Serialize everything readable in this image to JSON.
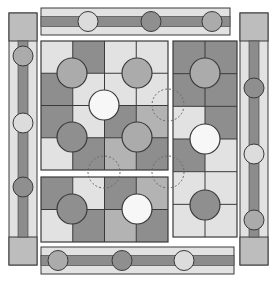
{
  "colors": {
    "light": "#e2e2e2",
    "mid": "#b3b3b3",
    "dark": "#8e8e8e",
    "white": "#f7f7f7",
    "token_mid": "#ababab",
    "token_dark": "#8f8f8f",
    "token_light": "#dcdcdc",
    "stroke": "#3a3a3a",
    "bar": "#8c8c8c",
    "cap": "#bdbdbd",
    "dashed": "#6a6a6a"
  },
  "boards": [
    {
      "name": "main-board",
      "x": 41,
      "y": 41,
      "cols": 4,
      "rows": 4,
      "cw": 31.75,
      "ch": 32.25,
      "cells": [
        [
          "light",
          "dark",
          "light",
          "light"
        ],
        [
          "dark",
          "light",
          "light",
          "light"
        ],
        [
          "dark",
          "light",
          "dark",
          "mid"
        ],
        [
          "light",
          "dark",
          "mid",
          "dark"
        ]
      ],
      "tokens": [
        {
          "cx": 72,
          "cy": 73,
          "r": 15,
          "fill": "token_mid"
        },
        {
          "cx": 137,
          "cy": 73,
          "r": 15,
          "fill": "token_mid"
        },
        {
          "cx": 104,
          "cy": 105,
          "r": 15,
          "fill": "white"
        },
        {
          "cx": 72,
          "cy": 137,
          "r": 15,
          "fill": "token_dark"
        },
        {
          "cx": 137,
          "cy": 137,
          "r": 15,
          "fill": "token_mid"
        }
      ]
    },
    {
      "name": "bottom-left-board",
      "x": 41,
      "y": 177,
      "cols": 4,
      "rows": 2,
      "cw": 31.75,
      "ch": 32.5,
      "cells": [
        [
          "dark",
          "light",
          "dark",
          "mid"
        ],
        [
          "light",
          "dark",
          "mid",
          "dark"
        ]
      ],
      "tokens": [
        {
          "cx": 72,
          "cy": 209,
          "r": 15,
          "fill": "token_dark"
        },
        {
          "cx": 137,
          "cy": 209,
          "r": 15,
          "fill": "white"
        }
      ]
    },
    {
      "name": "right-board",
      "x": 173,
      "y": 41,
      "cols": 2,
      "rows": 6,
      "cw": 32,
      "ch": 32.67,
      "cells": [
        [
          "dark",
          "dark"
        ],
        [
          "dark",
          "dark"
        ],
        [
          "light",
          "dark"
        ],
        [
          "dark",
          "light"
        ],
        [
          "light",
          "light"
        ],
        [
          "light",
          "light"
        ]
      ],
      "tokens": [
        {
          "cx": 205,
          "cy": 73,
          "r": 15,
          "fill": "token_mid"
        },
        {
          "cx": 205,
          "cy": 139,
          "r": 15,
          "fill": "white"
        },
        {
          "cx": 205,
          "cy": 205,
          "r": 15,
          "fill": "token_dark"
        }
      ]
    }
  ],
  "dashed_targets": [
    {
      "cx": 168,
      "cy": 105,
      "r": 16
    },
    {
      "cx": 104,
      "cy": 172,
      "r": 16
    },
    {
      "cx": 168,
      "cy": 172,
      "r": 16
    }
  ],
  "strips": [
    {
      "name": "top-strip",
      "orient": "h",
      "x": 41,
      "y": 8,
      "w": 189,
      "h": 27,
      "tokens": [
        {
          "pos": 88,
          "fill": "token_light"
        },
        {
          "pos": 151,
          "fill": "token_dark"
        },
        {
          "pos": 212,
          "fill": "token_mid"
        }
      ]
    },
    {
      "name": "bottom-strip",
      "orient": "h",
      "x": 41,
      "y": 247,
      "w": 193,
      "h": 27,
      "tokens": [
        {
          "pos": 58,
          "fill": "token_mid"
        },
        {
          "pos": 122,
          "fill": "token_dark"
        },
        {
          "pos": 184,
          "fill": "token_light"
        }
      ]
    },
    {
      "name": "left-strip",
      "orient": "v",
      "x": 9,
      "y": 13,
      "w": 28,
      "h": 252,
      "cap": 28,
      "tokens": [
        {
          "pos": 56,
          "fill": "token_mid"
        },
        {
          "pos": 123,
          "fill": "token_light"
        },
        {
          "pos": 187,
          "fill": "token_dark"
        }
      ]
    },
    {
      "name": "right-strip",
      "orient": "v",
      "x": 240,
      "y": 13,
      "w": 28,
      "h": 252,
      "cap": 28,
      "tokens": [
        {
          "pos": 88,
          "fill": "token_dark"
        },
        {
          "pos": 154,
          "fill": "token_light"
        },
        {
          "pos": 220,
          "fill": "token_mid"
        }
      ]
    }
  ]
}
